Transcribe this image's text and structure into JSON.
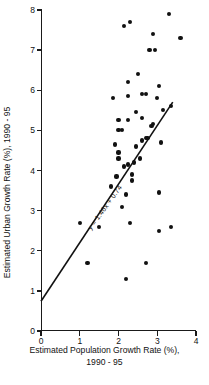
{
  "chart_data": {
    "type": "scatter",
    "title": "",
    "xlabel": "Estimated Population Growth Rate (%), 1990 - 95",
    "xlabel_line1": "Estimated Population Growth Rate (%),",
    "xlabel_line2": "1990 - 95",
    "ylabel": "Estimated Urban Growth Rate (%), 1990 - 95",
    "xlim": [
      0,
      4
    ],
    "ylim": [
      0,
      8
    ],
    "xticks": [
      0,
      1,
      2,
      3,
      4
    ],
    "yticks": [
      0,
      1,
      2,
      3,
      4,
      5,
      6,
      7,
      8
    ],
    "xticklabels": [
      "0",
      "1",
      "2",
      "3",
      "4"
    ],
    "yticklabels": [
      "0",
      "1",
      "2",
      "3",
      "4",
      "5",
      "6",
      "7",
      "8"
    ],
    "grid": false,
    "legend": null,
    "marker": "filled-circle",
    "marker_color": "#111111",
    "annotations": [
      {
        "text": "y = 1.46x + 0.74",
        "x": 1.25,
        "y": 2.55,
        "rotation_deg": -54
      }
    ],
    "fit_line": {
      "equation": "y = 1.46x + 0.74",
      "slope": 1.46,
      "intercept": 0.74,
      "x_start": 0.0,
      "x_end": 3.4,
      "color": "#111111"
    },
    "points": [
      {
        "x": 1.0,
        "y": 2.7
      },
      {
        "x": 1.2,
        "y": 1.7
      },
      {
        "x": 1.5,
        "y": 2.6
      },
      {
        "x": 2.1,
        "y": 3.1
      },
      {
        "x": 2.2,
        "y": 3.4
      },
      {
        "x": 2.3,
        "y": 2.7
      },
      {
        "x": 2.35,
        "y": 3.75
      },
      {
        "x": 2.7,
        "y": 1.7
      },
      {
        "x": 3.05,
        "y": 2.5
      },
      {
        "x": 3.05,
        "y": 3.45
      },
      {
        "x": 3.35,
        "y": 2.6
      },
      {
        "x": 1.8,
        "y": 3.6
      },
      {
        "x": 2.0,
        "y": 4.3
      },
      {
        "x": 2.15,
        "y": 4.1
      },
      {
        "x": 2.25,
        "y": 4.15
      },
      {
        "x": 2.4,
        "y": 4.2
      },
      {
        "x": 2.55,
        "y": 4.3
      },
      {
        "x": 2.0,
        "y": 4.45
      },
      {
        "x": 1.95,
        "y": 3.85
      },
      {
        "x": 2.35,
        "y": 3.9
      },
      {
        "x": 1.9,
        "y": 4.65
      },
      {
        "x": 2.45,
        "y": 4.6
      },
      {
        "x": 2.6,
        "y": 4.75
      },
      {
        "x": 2.7,
        "y": 4.8
      },
      {
        "x": 2.75,
        "y": 4.8
      },
      {
        "x": 3.1,
        "y": 4.7
      },
      {
        "x": 2.0,
        "y": 5.0
      },
      {
        "x": 2.1,
        "y": 5.0
      },
      {
        "x": 2.0,
        "y": 5.25
      },
      {
        "x": 2.25,
        "y": 5.25
      },
      {
        "x": 2.85,
        "y": 5.1
      },
      {
        "x": 2.9,
        "y": 5.15
      },
      {
        "x": 2.45,
        "y": 5.45
      },
      {
        "x": 2.6,
        "y": 5.3
      },
      {
        "x": 3.15,
        "y": 5.5
      },
      {
        "x": 3.35,
        "y": 5.6
      },
      {
        "x": 1.85,
        "y": 5.8
      },
      {
        "x": 2.25,
        "y": 5.85
      },
      {
        "x": 2.6,
        "y": 5.9
      },
      {
        "x": 2.7,
        "y": 5.9
      },
      {
        "x": 3.0,
        "y": 5.8
      },
      {
        "x": 2.25,
        "y": 6.2
      },
      {
        "x": 2.5,
        "y": 6.4
      },
      {
        "x": 3.05,
        "y": 6.1
      },
      {
        "x": 2.8,
        "y": 7.0
      },
      {
        "x": 2.95,
        "y": 7.0
      },
      {
        "x": 2.15,
        "y": 7.6
      },
      {
        "x": 2.3,
        "y": 7.7
      },
      {
        "x": 2.9,
        "y": 7.4
      },
      {
        "x": 3.3,
        "y": 7.9
      },
      {
        "x": 3.6,
        "y": 7.3
      },
      {
        "x": 2.2,
        "y": 1.3
      }
    ]
  }
}
